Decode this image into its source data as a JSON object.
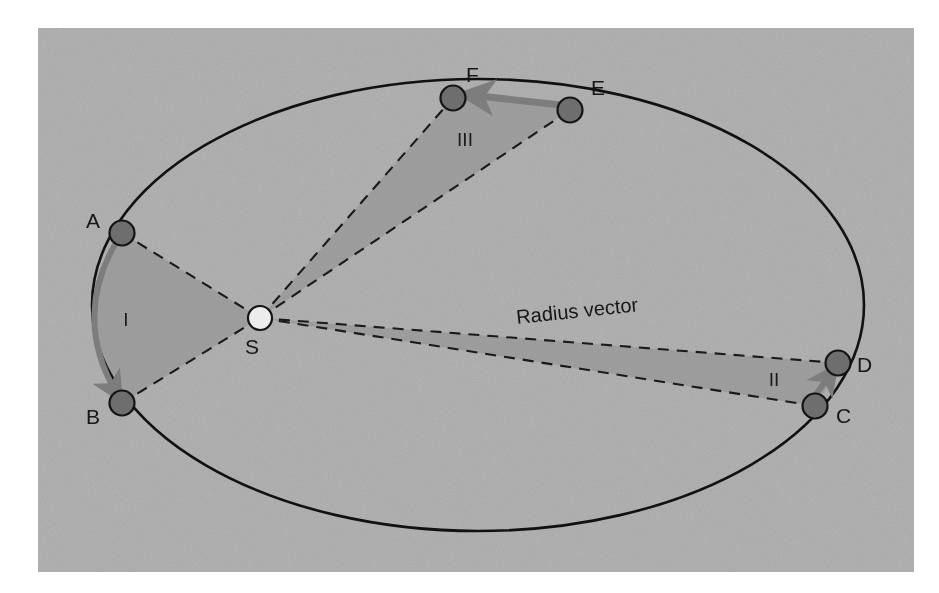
{
  "figure": {
    "background_color": "#b3b3b3",
    "page_color": "#ffffff",
    "orbit_color": "#111111",
    "planet_color": "#6e6e6e",
    "sun_color": "#e8e8e8",
    "sector_fill": "#8f8f8f",
    "arrow_color": "#7d7d7d",
    "dash_color": "#1a1a1a"
  },
  "labels": {
    "A": "A",
    "B": "B",
    "C": "C",
    "D": "D",
    "E": "E",
    "F": "F",
    "S": "S",
    "sector_1": "I",
    "sector_2": "II",
    "sector_3": "III",
    "radius_vector": "Radius vector"
  },
  "points": [
    {
      "id": "A",
      "label": "A",
      "x": 122,
      "y": 233,
      "kind": "planet",
      "label_x": 100,
      "label_y": 228
    },
    {
      "id": "B",
      "label": "B",
      "x": 122,
      "y": 403,
      "kind": "planet",
      "label_x": 100,
      "label_y": 424
    },
    {
      "id": "C",
      "label": "C",
      "x": 815,
      "y": 406,
      "kind": "planet",
      "label_x": 836,
      "label_y": 423
    },
    {
      "id": "D",
      "label": "D",
      "x": 838,
      "y": 363,
      "kind": "planet",
      "label_x": 858,
      "label_y": 371
    },
    {
      "id": "E",
      "label": "E",
      "x": 570,
      "y": 110,
      "kind": "planet",
      "label_x": 591,
      "label_y": 95
    },
    {
      "id": "F",
      "label": "F",
      "x": 453,
      "y": 98,
      "kind": "planet",
      "label_x": 466,
      "label_y": 82
    },
    {
      "id": "S",
      "label": "S",
      "x": 260,
      "y": 318,
      "kind": "sun",
      "label_x": 252,
      "label_y": 352
    }
  ],
  "orbit": {
    "shape": "ellipse",
    "center_x": 478,
    "center_y": 305,
    "radius_x": 386,
    "radius_y": 226
  },
  "sectors": [
    {
      "id": "I",
      "label": "I",
      "from": "A",
      "to": "B",
      "label_x": 126,
      "label_y": 326
    },
    {
      "id": "II",
      "label": "II",
      "from": "C",
      "to": "D",
      "label_x": 772,
      "label_y": 386
    },
    {
      "id": "III",
      "label": "III",
      "from": "E",
      "to": "F",
      "label_x": 461,
      "label_y": 146
    }
  ],
  "motion_arrows": [
    {
      "id": "arrow-a-b",
      "from": "A",
      "to": "B",
      "style": "curved"
    },
    {
      "id": "arrow-c-d",
      "from": "C",
      "to": "D",
      "style": "straight"
    },
    {
      "id": "arrow-e-f",
      "from": "E",
      "to": "F",
      "style": "straight"
    }
  ],
  "annotation": {
    "text": "Radius vector",
    "x": 517,
    "y": 324,
    "rotation_deg": -6
  }
}
